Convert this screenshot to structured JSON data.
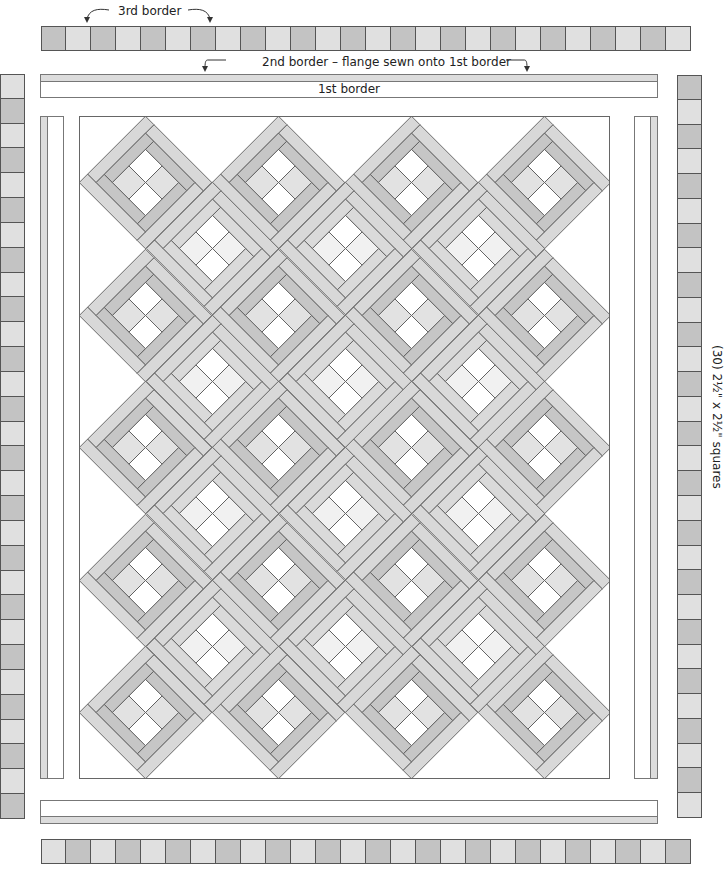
{
  "labels": {
    "third_border": "3rd border",
    "second_border": "2nd border – flange sewn onto 1st border",
    "first_border": "1st border",
    "squares_note": "(30)  2½\" x 2½\" squares"
  },
  "colors": {
    "dark_square": "#c3c3c3",
    "light_square": "#e0e0e0",
    "outline": "#555555",
    "flange": "#dcdcdc",
    "white": "#ffffff",
    "frame_dark": "#c6c6c6",
    "frame_light": "#dadada",
    "lattice": "#d8d8d8",
    "fourpatch_white": "#ffffff",
    "fourpatch_light": "#e2e2e2",
    "fourpatch_pale": "#f1f1f1"
  },
  "third_border": {
    "top": {
      "count": 26,
      "start": "dark",
      "x": 41,
      "y": 26,
      "size": 25
    },
    "bottom": {
      "count": 26,
      "start": "light",
      "x": 41,
      "y": 839,
      "size": 25
    },
    "left": {
      "count": 30,
      "start": "light",
      "x": 0,
      "y": 74,
      "size": 24.83
    },
    "right": {
      "count": 30,
      "start": "dark",
      "x": 677,
      "y": 75,
      "size": 24.77
    }
  },
  "quilt_center": {
    "width": 530,
    "height": 662,
    "block_half_diagonal": 66.25,
    "rows": [
      {
        "y": 66,
        "x": [
          66,
          199,
          332,
          465
        ],
        "type": "A"
      },
      {
        "y": 132,
        "x": [
          133,
          266,
          399
        ],
        "type": "B"
      },
      {
        "y": 199,
        "x": [
          66,
          199,
          332,
          465
        ],
        "type": "A"
      },
      {
        "y": 265,
        "x": [
          133,
          266,
          399
        ],
        "type": "B"
      },
      {
        "y": 331,
        "x": [
          66,
          199,
          332,
          465
        ],
        "type": "A"
      },
      {
        "y": 397,
        "x": [
          133,
          266,
          399
        ],
        "type": "B"
      },
      {
        "y": 464,
        "x": [
          66,
          199,
          332,
          465
        ],
        "type": "A"
      },
      {
        "y": 530,
        "x": [
          133,
          266,
          399
        ],
        "type": "B"
      },
      {
        "y": 596,
        "x": [
          66,
          199,
          332,
          465
        ],
        "type": "A"
      }
    ],
    "block_count": 32
  }
}
